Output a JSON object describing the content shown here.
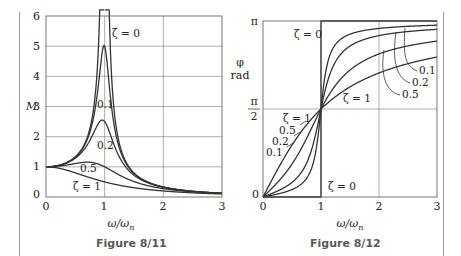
{
  "figures": [
    {
      "caption": "Figure 8/11"
    },
    {
      "caption": "Figure 8/12"
    }
  ],
  "chart_data": [
    {
      "type": "line",
      "title": "Figure 8/11",
      "xlabel": "ω/ω_n",
      "ylabel": "M",
      "xlim": [
        0,
        3
      ],
      "ylim": [
        0,
        6
      ],
      "xticks": [
        "0",
        "1",
        "2",
        "3"
      ],
      "yticks": [
        "0",
        "1",
        "2",
        "3",
        "4",
        "5",
        "6"
      ],
      "grid": true,
      "formula": "M = 1/sqrt((1-r^2)^2 + (2*zeta*r)^2)",
      "series": [
        {
          "name": "ζ = 0",
          "zeta": 0,
          "label_pos": [
            1.15,
            5.35
          ]
        },
        {
          "name": "0.1",
          "zeta": 0.1,
          "label_pos": [
            0.97,
            2.95
          ],
          "peak": 5.03
        },
        {
          "name": "0.2",
          "zeta": 0.2,
          "label_pos": [
            1.0,
            1.7
          ],
          "peak": 2.55
        },
        {
          "name": "0.5",
          "zeta": 0.5,
          "label_pos": [
            0.68,
            0.9
          ],
          "peak": 1.15
        },
        {
          "name": "ζ = 1",
          "zeta": 1,
          "label_pos": [
            0.65,
            0.38
          ]
        }
      ]
    },
    {
      "type": "line",
      "title": "Figure 8/12",
      "xlabel": "ω/ω_n",
      "ylabel": "φ rad",
      "xlim": [
        0,
        3
      ],
      "ylim": [
        0,
        3.14159
      ],
      "xticks": [
        "0",
        "1",
        "2",
        "3"
      ],
      "yticks": [
        "0",
        "π/2",
        "π"
      ],
      "grid": true,
      "formula": "phi = atan2(2*zeta*r, 1-r^2)",
      "series": [
        {
          "name": "ζ = 0",
          "zeta": 0
        },
        {
          "name": "0.1",
          "zeta": 0.1
        },
        {
          "name": "0.2",
          "zeta": 0.2
        },
        {
          "name": "0.5",
          "zeta": 0.5
        },
        {
          "name": "ζ = 1",
          "zeta": 1
        }
      ],
      "annotations": [
        "ζ = 0 (upper)",
        "ζ = 0 (lower)",
        "ζ = 1 (upper)",
        "ζ = 1 (lower)",
        "0.5",
        "0.2",
        "0.1",
        "0.1",
        "0.2",
        "0.5"
      ]
    }
  ],
  "labels": {
    "left_ylabel": "M",
    "right_ylabel_1": "φ",
    "right_ylabel_2": "rad",
    "xlabel": "ω/ω",
    "xlabel_sub": "n",
    "zeta0": "ζ = 0",
    "zeta1": "ζ = 1",
    "z01": "0.1",
    "z02": "0.2",
    "z05": "0.5",
    "pi": "π",
    "pi_num": "π",
    "pi_den": "2",
    "zero": "0"
  }
}
